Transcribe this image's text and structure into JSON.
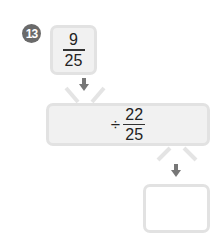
{
  "problem": {
    "number": "13",
    "start_value": {
      "numerator": "9",
      "denominator": "25"
    },
    "operation": {
      "operator": "÷",
      "numerator": "22",
      "denominator": "25"
    },
    "result_value": ""
  },
  "colors": {
    "badge": "#6a6a6a",
    "box_fill": "#f1f1f1",
    "box_border": "#e2e2e2",
    "arrow": "#777777"
  }
}
